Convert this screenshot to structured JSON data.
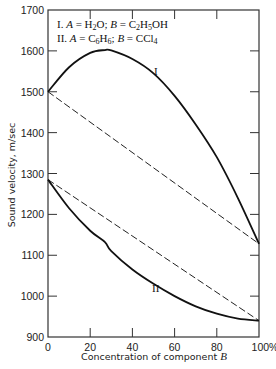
{
  "chart_data": {
    "type": "line",
    "title": "",
    "xlabel": "Concentration of component B",
    "ylabel": "Sound velocity, m/sec",
    "xlim": [
      0,
      100
    ],
    "ylim": [
      900,
      1700
    ],
    "x_ticks": [
      0,
      20,
      40,
      60,
      80,
      100
    ],
    "x_tick_labels": [
      "0",
      "20",
      "40",
      "60",
      "80",
      "100%"
    ],
    "y_ticks": [
      900,
      1000,
      1100,
      1200,
      1300,
      1400,
      1500,
      1600,
      1700
    ],
    "y_tick_labels": [
      "900",
      "1000",
      "1100",
      "1200",
      "1300",
      "1400",
      "1500",
      "1600",
      "1700"
    ],
    "grid": false,
    "legend": [
      "I. A = H2O;  B = C2H5OH",
      "II. A = C6H6;  B = CCl4"
    ],
    "legend_position": "top-left inside",
    "x": [
      0,
      10,
      20,
      27,
      30,
      40,
      50,
      60,
      70,
      80,
      90,
      100
    ],
    "series": [
      {
        "name": "I",
        "style": "solid",
        "values": [
          1500,
          1560,
          1595,
          1602,
          1601,
          1580,
          1545,
          1490,
          1420,
          1340,
          1240,
          1128
        ]
      },
      {
        "name": "II",
        "style": "solid",
        "values": [
          1285,
          1215,
          1160,
          1132,
          1110,
          1065,
          1030,
          1000,
          975,
          957,
          945,
          940
        ]
      },
      {
        "name": "I (linear, ideal)",
        "style": "dashed",
        "x": [
          0,
          100
        ],
        "values": [
          1500,
          1128
        ]
      },
      {
        "name": "II (linear, ideal)",
        "style": "dashed",
        "x": [
          0,
          100
        ],
        "values": [
          1285,
          940
        ]
      }
    ],
    "annotations": [
      {
        "text": "I",
        "x": 51,
        "y": 1555
      },
      {
        "text": "II",
        "x": 51,
        "y": 1018
      }
    ]
  },
  "labels": {
    "legend_line1_prefix": "I. ",
    "legend_line2_prefix": "II. ",
    "curve_I": "I",
    "curve_II": "II"
  }
}
